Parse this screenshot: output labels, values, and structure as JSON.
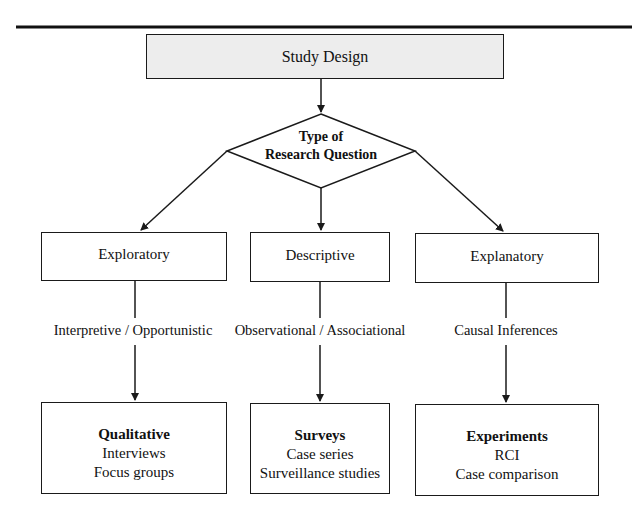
{
  "diagram": {
    "root": {
      "label": "Study Design"
    },
    "decision": {
      "line1": "Type of",
      "line2": "Research Question"
    },
    "branches": [
      {
        "category": "Exploratory",
        "relation": "Interpretive / Opportunistic",
        "outcome": {
          "head": "Qualitative",
          "items": [
            "Interviews",
            "Focus groups"
          ]
        }
      },
      {
        "category": "Descriptive",
        "relation": "Observational / Associational",
        "outcome": {
          "head": "Surveys",
          "items": [
            "Case series",
            "Surveillance studies"
          ]
        }
      },
      {
        "category": "Explanatory",
        "relation": "Causal Inferences",
        "outcome": {
          "head": "Experiments",
          "items": [
            "RCI",
            "Case comparison"
          ]
        }
      }
    ]
  },
  "colors": {
    "line": "#1a1a1a",
    "root_fill": "#ededed",
    "box_fill": "#ffffff"
  }
}
